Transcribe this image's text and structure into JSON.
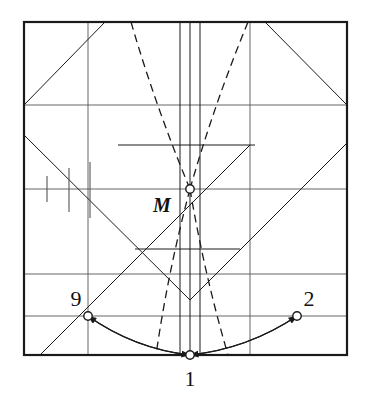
{
  "figure": {
    "background_color": "#ffffff",
    "ink_color": "#1a1a1a",
    "grid_color": "#555555",
    "frame": {
      "x0": 24,
      "y0": 22,
      "x1": 347,
      "y1": 355,
      "stroke_width": 2.2
    },
    "grid": {
      "horizontal_y": [
        105,
        189,
        274,
        316
      ],
      "vertical_x": [
        88,
        250
      ],
      "center_vertical_x": [
        180,
        190,
        200
      ],
      "stroke_width": 0.9
    },
    "points": [
      {
        "id": "M",
        "label": "M",
        "x": 190,
        "y": 189,
        "label_x": 162,
        "label_y": 212,
        "radius": 4.2
      },
      {
        "id": "p1",
        "label": "1",
        "x": 190,
        "y": 355,
        "label_x": 190,
        "label_y": 386,
        "radius": 4.2
      },
      {
        "id": "p9",
        "label": "9",
        "x": 88,
        "y": 316,
        "label_x": 76,
        "label_y": 306,
        "radius": 4.2
      },
      {
        "id": "p2",
        "label": "2",
        "x": 297,
        "y": 316,
        "label_x": 309,
        "label_y": 306,
        "radius": 4.2
      }
    ],
    "solid_lines": [
      {
        "name": "upper-left-diagonal",
        "x1": 24,
        "y1": 105,
        "x2": 105,
        "y2": 22
      },
      {
        "name": "upper-right-diagonal",
        "x1": 265,
        "y1": 22,
        "x2": 347,
        "y2": 105
      },
      {
        "name": "left-descending-long",
        "x1": 24,
        "y1": 135,
        "x2": 190,
        "y2": 300
      },
      {
        "name": "right-ascending-long",
        "x1": 190,
        "y1": 300,
        "x2": 347,
        "y2": 143
      },
      {
        "name": "lowleft-rising",
        "x1": 40,
        "y1": 355,
        "x2": 250,
        "y2": 145
      },
      {
        "name": "mid-horizontal-upper",
        "x1": 118,
        "y1": 145,
        "x2": 255,
        "y2": 145
      },
      {
        "name": "mid-horizontal-lower",
        "x1": 135,
        "y1": 249,
        "x2": 240,
        "y2": 249
      }
    ],
    "tick_marks": [
      {
        "name": "tick-1",
        "x": 47,
        "y_top": 176,
        "y_bottom": 202
      },
      {
        "name": "tick-2",
        "x": 69,
        "y_top": 168,
        "y_bottom": 212
      },
      {
        "name": "tick-3",
        "x": 90,
        "y_top": 162,
        "y_bottom": 218
      }
    ],
    "dashed_curves": [
      {
        "name": "dashed-left-upper",
        "x1": 131,
        "y1": 22,
        "x2": 190,
        "y2": 189
      },
      {
        "name": "dashed-right-upper",
        "x1": 248,
        "y1": 22,
        "x2": 190,
        "y2": 189
      },
      {
        "name": "dashed-left-lower",
        "x1": 190,
        "y1": 189,
        "x2": 156,
        "y2": 355
      },
      {
        "name": "dashed-right-lower",
        "x1": 190,
        "y1": 189,
        "x2": 228,
        "y2": 355
      }
    ],
    "arrow_arcs": [
      {
        "name": "arc-to-point-9",
        "from_x": 190,
        "from_y": 355,
        "to_x": 88,
        "to_y": 316,
        "bow": 14
      },
      {
        "name": "arc-to-point-1-left",
        "from_x": 88,
        "from_y": 316,
        "to_x": 190,
        "to_y": 355,
        "bow": 14
      },
      {
        "name": "arc-to-point-2",
        "from_x": 190,
        "from_y": 355,
        "to_x": 297,
        "to_y": 316,
        "bow": 14
      },
      {
        "name": "arc-to-point-1-right",
        "from_x": 297,
        "from_y": 316,
        "to_x": 190,
        "to_y": 355,
        "bow": 14
      }
    ]
  }
}
